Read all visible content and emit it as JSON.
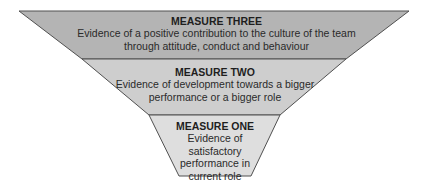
{
  "diagram": {
    "type": "inverted-funnel",
    "colors": {
      "top": "#b4b4b4",
      "middle": "#cecece",
      "bottom": "#dedede",
      "outline": "#505050"
    },
    "levels": [
      {
        "title": "MEASURE THREE",
        "description_lines": [
          "Evidence of a positive contribution to the culture of the team",
          "through attitude, conduct and behaviour"
        ]
      },
      {
        "title": "MEASURE TWO",
        "description_lines": [
          "Evidence of development towards a bigger",
          "performance or a bigger role"
        ]
      },
      {
        "title": "MEASURE ONE",
        "description_lines": [
          "Evidence of",
          "satisfactory",
          "performance in",
          "current role"
        ]
      }
    ]
  }
}
